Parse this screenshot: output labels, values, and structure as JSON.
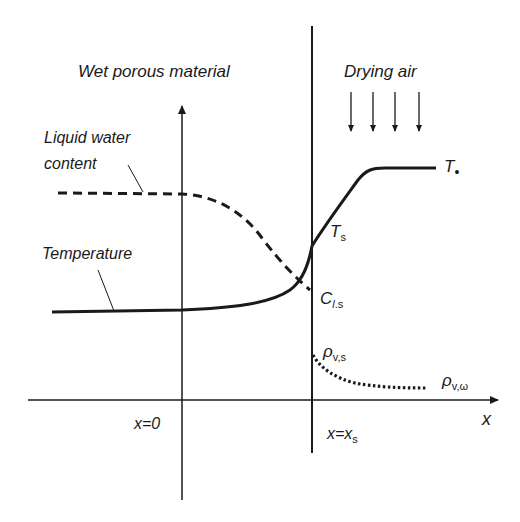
{
  "diagram": {
    "labels": {
      "material": "Wet porous material",
      "air": "Drying air",
      "liquid_water": [
        "Liquid water",
        "content"
      ],
      "temperature": "Temperature",
      "T_inf": "T",
      "T_inf_sub": "•",
      "T_s": "T",
      "T_s_sub": "s",
      "C_ls": "C",
      "C_ls_sub_l": "l",
      "C_ls_sub_s": ".s",
      "rho_vs": "ρ",
      "rho_vs_sub": "v,s",
      "rho_vinf": "ρ",
      "rho_vinf_sub": "v,ω",
      "x_axis": "x",
      "x0": "x=0",
      "xs": "x=x",
      "xs_sub": "s"
    },
    "curves": [
      {
        "name": "Liquid water content",
        "style": "dashed",
        "description": "flat high in material, decreasing to C_l,s at surface"
      },
      {
        "name": "Temperature",
        "style": "solid",
        "description": "flat low in material, rising steeply at surface to T_s, then to T_inf in air"
      },
      {
        "name": "Vapor density",
        "style": "dotted",
        "description": "from rho_v,s at surface decaying to rho_v,inf in air"
      }
    ],
    "air_arrows": 4,
    "colors": {
      "line": "#1a1a1a",
      "background": "#ffffff"
    }
  }
}
